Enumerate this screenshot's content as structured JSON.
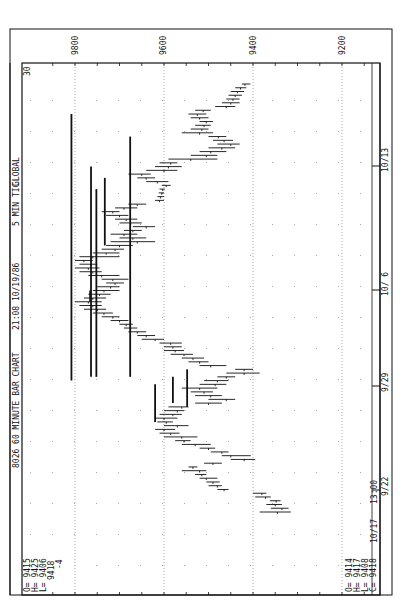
{
  "chart_data": {
    "type": "bar",
    "subtype": "ohlc-rotated",
    "title": "8026 60 MINUTE BAR CHART",
    "header": {
      "symbol_title": "8026 60 MINUTE BAR CHART",
      "timestamp": "21:08 10/19/86",
      "interval": "5 MIN TIC",
      "mode": "GLOBAL"
    },
    "corner_label": "30",
    "price_axis": {
      "ticks": [
        9800,
        9600,
        9400,
        9200
      ],
      "tick_labels": [
        "9800",
        "9600",
        "9400",
        "9200"
      ],
      "range": [
        9880,
        9150
      ],
      "grid": "dotted"
    },
    "time_axis": {
      "tick_labels": [
        "9/22",
        "9/29",
        "10/ 6",
        "10/13"
      ],
      "start_label": "13:00",
      "end_label": "10/17"
    },
    "left_readout": {
      "O": "9415",
      "H": "9425",
      "L": "9406",
      "close": "9418",
      "change": "-4"
    },
    "right_readout": {
      "O": "9414",
      "H": "9417",
      "L": "9408",
      "C": "9418"
    },
    "bars": [
      {
        "h": 9385,
        "l": 9315,
        "c": 9345
      },
      {
        "h": 9360,
        "l": 9320,
        "c": 9335
      },
      {
        "h": 9370,
        "l": 9335,
        "c": 9350
      },
      {
        "h": 9362,
        "l": 9338,
        "c": 9348
      },
      {
        "h": 9395,
        "l": 9360,
        "c": 9372
      },
      {
        "h": 9400,
        "l": 9370,
        "c": 9380
      },
      {
        "h": 9480,
        "l": 9455,
        "c": 9465
      },
      {
        "h": 9500,
        "l": 9470,
        "c": 9480
      },
      {
        "h": 9505,
        "l": 9475,
        "c": 9490
      },
      {
        "h": 9520,
        "l": 9480,
        "c": 9505
      },
      {
        "h": 9530,
        "l": 9505,
        "c": 9515
      },
      {
        "h": 9560,
        "l": 9505,
        "c": 9520
      },
      {
        "h": 9545,
        "l": 9525,
        "c": 9535
      },
      {
        "h": 9510,
        "l": 9470,
        "c": 9490
      },
      {
        "h": 9450,
        "l": 9395,
        "c": 9420
      },
      {
        "h": 9470,
        "l": 9405,
        "c": 9450
      },
      {
        "h": 9495,
        "l": 9455,
        "c": 9470
      },
      {
        "h": 9520,
        "l": 9485,
        "c": 9500
      },
      {
        "h": 9560,
        "l": 9495,
        "c": 9530
      },
      {
        "h": 9575,
        "l": 9540,
        "c": 9555
      },
      {
        "h": 9600,
        "l": 9525,
        "c": 9560
      },
      {
        "h": 9610,
        "l": 9565,
        "c": 9585
      },
      {
        "h": 9620,
        "l": 9575,
        "c": 9600
      },
      {
        "h": 9600,
        "l": 9545,
        "c": 9570
      },
      {
        "h": 9615,
        "l": 9580,
        "c": 9595
      },
      {
        "h": 9620,
        "l": 9570,
        "c": 9600
      },
      {
        "h": 9610,
        "l": 9560,
        "c": 9580
      },
      {
        "h": 9600,
        "l": 9555,
        "c": 9570
      },
      {
        "h": 9590,
        "l": 9545,
        "c": 9560
      },
      {
        "h": 9530,
        "l": 9470,
        "c": 9500
      },
      {
        "h": 9500,
        "l": 9440,
        "c": 9460
      },
      {
        "h": 9530,
        "l": 9470,
        "c": 9495
      },
      {
        "h": 9540,
        "l": 9490,
        "c": 9510
      },
      {
        "h": 9560,
        "l": 9480,
        "c": 9520
      },
      {
        "h": 9520,
        "l": 9460,
        "c": 9485
      },
      {
        "h": 9510,
        "l": 9455,
        "c": 9480
      },
      {
        "h": 9480,
        "l": 9440,
        "c": 9460
      },
      {
        "h": 9460,
        "l": 9385,
        "c": 9420
      },
      {
        "h": 9440,
        "l": 9400,
        "c": 9420
      },
      {
        "h": 9520,
        "l": 9460,
        "c": 9495
      },
      {
        "h": 9545,
        "l": 9500,
        "c": 9520
      },
      {
        "h": 9560,
        "l": 9510,
        "c": 9535
      },
      {
        "h": 9585,
        "l": 9535,
        "c": 9555
      },
      {
        "h": 9600,
        "l": 9555,
        "c": 9575
      },
      {
        "h": 9600,
        "l": 9560,
        "c": 9580
      },
      {
        "h": 9610,
        "l": 9560,
        "c": 9585
      },
      {
        "h": 9650,
        "l": 9600,
        "c": 9620
      },
      {
        "h": 9660,
        "l": 9620,
        "c": 9640
      },
      {
        "h": 9680,
        "l": 9640,
        "c": 9660
      },
      {
        "h": 9690,
        "l": 9660,
        "c": 9675
      },
      {
        "h": 9700,
        "l": 9670,
        "c": 9685
      },
      {
        "h": 9720,
        "l": 9680,
        "c": 9700
      },
      {
        "h": 9740,
        "l": 9700,
        "c": 9715
      },
      {
        "h": 9760,
        "l": 9715,
        "c": 9735
      },
      {
        "h": 9780,
        "l": 9730,
        "c": 9750
      },
      {
        "h": 9790,
        "l": 9740,
        "c": 9760
      },
      {
        "h": 9800,
        "l": 9740,
        "c": 9770
      },
      {
        "h": 9780,
        "l": 9730,
        "c": 9760
      },
      {
        "h": 9770,
        "l": 9720,
        "c": 9745
      },
      {
        "h": 9760,
        "l": 9700,
        "c": 9735
      },
      {
        "h": 9750,
        "l": 9700,
        "c": 9720
      },
      {
        "h": 9730,
        "l": 9690,
        "c": 9710
      },
      {
        "h": 9740,
        "l": 9680,
        "c": 9715
      },
      {
        "h": 9770,
        "l": 9700,
        "c": 9740
      },
      {
        "h": 9790,
        "l": 9740,
        "c": 9760
      },
      {
        "h": 9800,
        "l": 9745,
        "c": 9770
      },
      {
        "h": 9790,
        "l": 9750,
        "c": 9765
      },
      {
        "h": 9800,
        "l": 9760,
        "c": 9780
      },
      {
        "h": 9790,
        "l": 9700,
        "c": 9760
      },
      {
        "h": 9760,
        "l": 9700,
        "c": 9730
      },
      {
        "h": 9740,
        "l": 9690,
        "c": 9710
      },
      {
        "h": 9730,
        "l": 9670,
        "c": 9700
      },
      {
        "h": 9720,
        "l": 9620,
        "c": 9660
      },
      {
        "h": 9700,
        "l": 9640,
        "c": 9670
      },
      {
        "h": 9720,
        "l": 9660,
        "c": 9690
      },
      {
        "h": 9690,
        "l": 9650,
        "c": 9670
      },
      {
        "h": 9670,
        "l": 9620,
        "c": 9640
      },
      {
        "h": 9700,
        "l": 9650,
        "c": 9675
      },
      {
        "h": 9710,
        "l": 9660,
        "c": 9685
      },
      {
        "h": 9730,
        "l": 9680,
        "c": 9700
      },
      {
        "h": 9740,
        "l": 9700,
        "c": 9715
      },
      {
        "h": 9710,
        "l": 9660,
        "c": 9690
      },
      {
        "h": 9680,
        "l": 9640,
        "c": 9660
      },
      {
        "h": 9620,
        "l": 9600,
        "c": 9610
      },
      {
        "h": 9615,
        "l": 9600,
        "c": 9608
      },
      {
        "h": 9612,
        "l": 9600,
        "c": 9605
      },
      {
        "h": 9610,
        "l": 9598,
        "c": 9603
      },
      {
        "h": 9605,
        "l": 9585,
        "c": 9595
      },
      {
        "h": 9640,
        "l": 9590,
        "c": 9615
      },
      {
        "h": 9660,
        "l": 9620,
        "c": 9640
      },
      {
        "h": 9680,
        "l": 9630,
        "c": 9650
      },
      {
        "h": 9640,
        "l": 9570,
        "c": 9600
      },
      {
        "h": 9620,
        "l": 9560,
        "c": 9590
      },
      {
        "h": 9610,
        "l": 9570,
        "c": 9585
      },
      {
        "h": 9590,
        "l": 9480,
        "c": 9540
      },
      {
        "h": 9540,
        "l": 9480,
        "c": 9505
      },
      {
        "h": 9520,
        "l": 9460,
        "c": 9495
      },
      {
        "h": 9500,
        "l": 9440,
        "c": 9470
      },
      {
        "h": 9480,
        "l": 9430,
        "c": 9450
      },
      {
        "h": 9490,
        "l": 9445,
        "c": 9465
      },
      {
        "h": 9500,
        "l": 9460,
        "c": 9478
      },
      {
        "h": 9560,
        "l": 9490,
        "c": 9520
      },
      {
        "h": 9540,
        "l": 9500,
        "c": 9515
      },
      {
        "h": 9530,
        "l": 9495,
        "c": 9510
      },
      {
        "h": 9520,
        "l": 9490,
        "c": 9505
      },
      {
        "h": 9540,
        "l": 9500,
        "c": 9520
      },
      {
        "h": 9545,
        "l": 9505,
        "c": 9525
      },
      {
        "h": 9530,
        "l": 9495,
        "c": 9512
      },
      {
        "h": 9485,
        "l": 9440,
        "c": 9460
      },
      {
        "h": 9470,
        "l": 9430,
        "c": 9450
      },
      {
        "h": 9460,
        "l": 9430,
        "c": 9445
      },
      {
        "h": 9455,
        "l": 9425,
        "c": 9440
      },
      {
        "h": 9450,
        "l": 9420,
        "c": 9435
      },
      {
        "h": 9440,
        "l": 9415,
        "c": 9428
      },
      {
        "h": 9425,
        "l": 9406,
        "c": 9418
      }
    ],
    "trend_lines": [
      {
        "price": 9808,
        "from_bar": 35,
        "to_bar": 106
      },
      {
        "price": 9764,
        "from_bar": 36,
        "to_bar": 92
      },
      {
        "price": 9766,
        "from_bar": 56,
        "to_bar": 59
      },
      {
        "price": 9760,
        "from_bar": 36,
        "to_bar": 36
      },
      {
        "price": 9752,
        "from_bar": 36,
        "to_bar": 86
      },
      {
        "price": 9733,
        "from_bar": 71,
        "to_bar": 89
      },
      {
        "price": 9704,
        "from_bar": 36,
        "to_bar": 36
      },
      {
        "price": 9676,
        "from_bar": 36,
        "to_bar": 100
      },
      {
        "price": 9627,
        "from_bar": 36,
        "to_bar": 36
      },
      {
        "price": 9620,
        "from_bar": 24,
        "to_bar": 34
      },
      {
        "price": 9580,
        "from_bar": 29,
        "to_bar": 36
      },
      {
        "price": 9548,
        "from_bar": 28,
        "to_bar": 38
      }
    ],
    "colors": {
      "ink": "#111111",
      "grid": "#888888",
      "background": "#ffffff"
    }
  }
}
